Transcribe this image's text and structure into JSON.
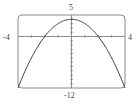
{
  "chart_data": {
    "type": "line",
    "title": "",
    "xlabel": "",
    "ylabel": "",
    "function": "y = 4 - x^2",
    "xlim": [
      -4,
      4
    ],
    "ylim": [
      -12,
      5
    ],
    "x_tick_step": 1,
    "y_tick_step": 1,
    "grid": false,
    "legend": null,
    "labels": {
      "xmin": "-4",
      "xmax": "4",
      "ymax": "5",
      "ymin": "-12"
    },
    "series": [
      {
        "name": "f(x)",
        "x": [
          -4,
          -3,
          -2,
          -1,
          0,
          1,
          2,
          3,
          4
        ],
        "y": [
          -12,
          -5,
          0,
          3,
          4,
          3,
          0,
          -5,
          -12
        ]
      }
    ],
    "colors": {
      "frame": "#8a8a8a",
      "axes": "#8a8a8a",
      "curve": "#3a3a3a"
    }
  }
}
